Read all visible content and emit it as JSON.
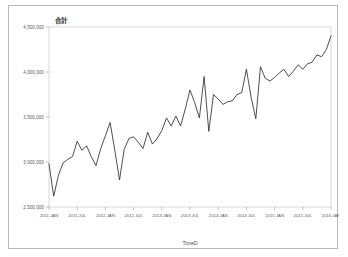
{
  "card": {
    "border_color": "#b9b9b9",
    "background": "#ffffff"
  },
  "chart_data": {
    "type": "line",
    "title": "合計",
    "xlabel": "TimeD",
    "ylabel": "",
    "ylim": [
      2500000,
      4500000
    ],
    "grid": false,
    "legend": "none",
    "line_color": "#3a3a3a",
    "ytick_labels": [
      "4,500,000",
      "4,000,000",
      "3,500,000",
      "3,000,000",
      "2,500,000"
    ],
    "ytick_values": [
      4500000,
      4000000,
      3500000,
      3000000,
      2500000
    ],
    "xtick_labels": [
      "2011.JAN",
      "2011.JUL",
      "2012.JAN",
      "2012.JUL",
      "2013.JAN",
      "2013.JUL",
      "2014.JAN",
      "2014.JUL",
      "2015.JAN",
      "2015.JUL",
      "2016.JAN"
    ],
    "xtick_indices": [
      0,
      6,
      12,
      18,
      24,
      30,
      36,
      42,
      48,
      54,
      60
    ],
    "x": [
      "2011.JAN",
      "2011.FEB",
      "2011.MAR",
      "2011.APR",
      "2011.MAY",
      "2011.JUN",
      "2011.JUL",
      "2011.AUG",
      "2011.SEP",
      "2011.OCT",
      "2011.NOV",
      "2011.DEC",
      "2012.JAN",
      "2012.FEB",
      "2012.MAR",
      "2012.APR",
      "2012.MAY",
      "2012.JUN",
      "2012.JUL",
      "2012.AUG",
      "2012.SEP",
      "2012.OCT",
      "2012.NOV",
      "2012.DEC",
      "2013.JAN",
      "2013.FEB",
      "2013.MAR",
      "2013.APR",
      "2013.MAY",
      "2013.JUN",
      "2013.JUL",
      "2013.AUG",
      "2013.SEP",
      "2013.OCT",
      "2013.NOV",
      "2013.DEC",
      "2014.JAN",
      "2014.FEB",
      "2014.MAR",
      "2014.APR",
      "2014.MAY",
      "2014.JUN",
      "2014.JUL",
      "2014.AUG",
      "2014.SEP",
      "2014.OCT",
      "2014.NOV",
      "2014.DEC",
      "2015.JAN",
      "2015.FEB",
      "2015.MAR",
      "2015.APR",
      "2015.MAY",
      "2015.JUN",
      "2015.JUL",
      "2015.AUG",
      "2015.SEP",
      "2015.OCT",
      "2015.NOV",
      "2015.DEC",
      "2016.JAN"
    ],
    "values": [
      2980000,
      2620000,
      2850000,
      2990000,
      3030000,
      3060000,
      3230000,
      3130000,
      3180000,
      3060000,
      2960000,
      3150000,
      3290000,
      3440000,
      3130000,
      2800000,
      3140000,
      3260000,
      3280000,
      3220000,
      3150000,
      3330000,
      3200000,
      3260000,
      3350000,
      3490000,
      3400000,
      3510000,
      3400000,
      3590000,
      3800000,
      3660000,
      3490000,
      3950000,
      3340000,
      3750000,
      3700000,
      3640000,
      3670000,
      3680000,
      3750000,
      3770000,
      4030000,
      3720000,
      3480000,
      4060000,
      3930000,
      3900000,
      3940000,
      3990000,
      4030000,
      3950000,
      4010000,
      4080000,
      4030000,
      4090000,
      4110000,
      4190000,
      4170000,
      4250000,
      4400000
    ]
  }
}
